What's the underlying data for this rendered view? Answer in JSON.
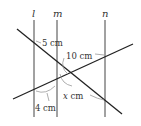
{
  "diagram": {
    "type": "geometry-parallel-lines-transversals",
    "parallel_lines": [
      {
        "name": "l",
        "x": 34
      },
      {
        "name": "m",
        "x": 57
      },
      {
        "name": "n",
        "x": 105
      }
    ],
    "transversals": [
      {
        "name": "descending",
        "from": [
          17,
          29
        ],
        "to": [
          122,
          114
        ]
      },
      {
        "name": "ascending",
        "from": [
          13,
          99
        ],
        "to": [
          133,
          44
        ]
      }
    ],
    "labels": {
      "line_l": "l",
      "line_m": "m",
      "line_n": "n",
      "seg_top_left": "5 cm",
      "seg_top_right": "10 cm",
      "seg_bottom_left": "4 cm",
      "seg_bottom_right_var": "x",
      "seg_bottom_right_unit": " cm"
    },
    "colors": {
      "line": "#333333",
      "leader": "#999999",
      "text": "#333333"
    }
  }
}
